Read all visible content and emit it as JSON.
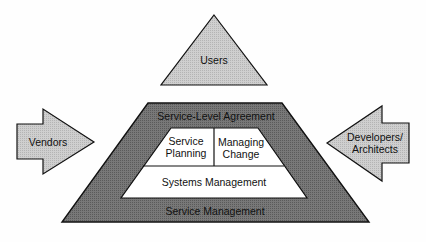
{
  "diagram": {
    "users": {
      "label": "Users"
    },
    "vendors": {
      "label": "Vendors"
    },
    "developers": {
      "label_line1": "Developers/",
      "label_line2": "Architects"
    },
    "outer_frame": {
      "top_label": "Service-Level Agreement",
      "bottom_label": "Service Management"
    },
    "inner": {
      "service_planning": {
        "line1": "Service",
        "line2": "Planning"
      },
      "managing_change": {
        "line1": "Managing",
        "line2": "Change"
      },
      "systems_management": {
        "label": "Systems Management"
      }
    },
    "colors": {
      "light_fill": "#c4c4c4",
      "dark_fill": "#6e6e6e",
      "inner_fill": "#ffffff",
      "stroke": "#111111"
    }
  }
}
